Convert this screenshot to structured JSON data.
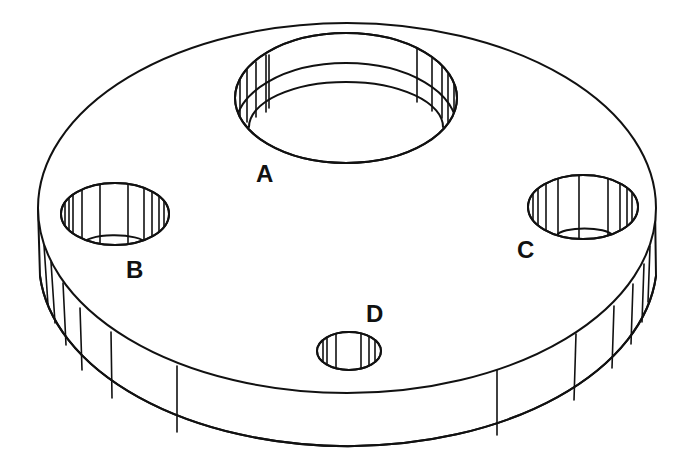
{
  "diagram": {
    "type": "isometric-part-drawing",
    "stroke_color": "#111111",
    "background": "#ffffff",
    "labels": [
      {
        "id": "A",
        "text": "A",
        "x": 256,
        "y": 162
      },
      {
        "id": "B",
        "text": "B",
        "x": 126,
        "y": 258
      },
      {
        "id": "C",
        "text": "C",
        "x": 517,
        "y": 238
      },
      {
        "id": "D",
        "text": "D",
        "x": 366,
        "y": 302
      }
    ],
    "holes": [
      {
        "id": "A",
        "label": "A",
        "size": "large"
      },
      {
        "id": "B",
        "label": "B",
        "size": "medium"
      },
      {
        "id": "C",
        "label": "C",
        "size": "medium"
      },
      {
        "id": "D",
        "label": "D",
        "size": "small"
      }
    ]
  }
}
